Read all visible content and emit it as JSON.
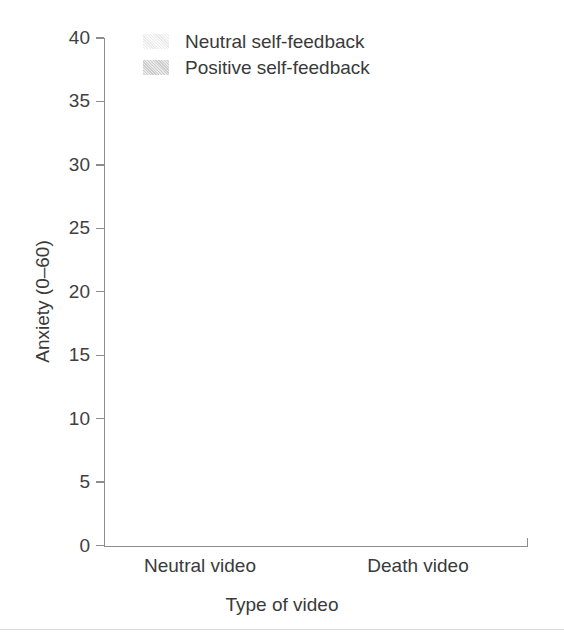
{
  "chart_data": {
    "type": "bar",
    "title": "",
    "xlabel": "Type of video",
    "ylabel": "Anxiety (0–60)",
    "categories": [
      "Neutral video",
      "Death video"
    ],
    "series": [
      {
        "name": "Neutral self-feedback",
        "values": [
          23.4,
          33.9
        ],
        "color": "#e6e6e6"
      },
      {
        "name": "Positive self-feedback",
        "values": [
          24.8,
          23.3
        ],
        "color": "#c9c9c9"
      }
    ],
    "ylim": [
      0,
      40
    ],
    "yticks": [
      0,
      5,
      10,
      15,
      20,
      25,
      30,
      35,
      40
    ],
    "ytick_labels": [
      "0",
      "5",
      "10",
      "15",
      "20",
      "25",
      "30",
      "35",
      "40"
    ],
    "grid": false,
    "legend_position": "top-left-inside"
  },
  "axes": {
    "y_title": "Anxiety (0–60)",
    "x_title": "Type of video",
    "tick_labels": [
      "40",
      "35",
      "30",
      "25",
      "20",
      "15",
      "10",
      "5",
      "0"
    ]
  },
  "legend": {
    "items": [
      {
        "label": "Neutral self-feedback",
        "swatch": "light-gray-swatch"
      },
      {
        "label": "Positive self-feedback",
        "swatch": "dark-gray-swatch"
      }
    ]
  },
  "categories": [
    {
      "label": "Neutral video"
    },
    {
      "label": "Death video"
    }
  ]
}
